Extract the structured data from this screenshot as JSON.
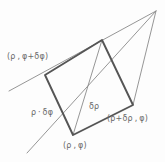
{
  "figure": {
    "background_color": "#fdfdfd",
    "stroke_color_thick": "#555555",
    "stroke_color_thin": "#8a8a8a",
    "text_color": "#6b6b6b",
    "labels": {
      "vertex_upper_left": "(ρ , φ+δφ)",
      "vertex_bottom": "(ρ , φ)",
      "vertex_bottom_right": "(ρ+δρ , φ)",
      "edge_arc_length": "ρ · δφ",
      "edge_radial_length": "δρ"
    },
    "geometry": {
      "quad_vertices": [
        {
          "name": "upper-left",
          "x": 45,
          "y": 75
        },
        {
          "name": "upper-right",
          "x": 102,
          "y": 40
        },
        {
          "name": "lower-right",
          "x": 133,
          "y": 105
        },
        {
          "name": "lower-left",
          "x": 73,
          "y": 135
        }
      ],
      "apex": {
        "x": 156,
        "y": 11
      },
      "ray_upper_start": {
        "x": 9,
        "y": 91
      },
      "ray_lower_start": {
        "x": 27,
        "y": 153
      }
    }
  }
}
